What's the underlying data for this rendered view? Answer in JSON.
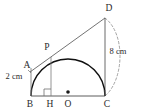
{
  "figure": {
    "type": "geometry-diagram",
    "background_color": "#ffffff",
    "stroke_color": "#3a3a3a",
    "arc_color": "#111111",
    "label_color": "#2b2b2b"
  },
  "points": {
    "A": {
      "label": "A",
      "x": 31,
      "y": 68,
      "label_x": 27,
      "label_y": 66
    },
    "B": {
      "label": "B",
      "x": 31,
      "y": 96,
      "label_x": 30,
      "label_y": 105
    },
    "H": {
      "label": "H",
      "x": 51,
      "y": 96,
      "label_x": 50,
      "label_y": 105
    },
    "O": {
      "label": "O",
      "x": 68,
      "y": 96,
      "label_x": 68,
      "label_y": 105
    },
    "C": {
      "label": "C",
      "x": 105,
      "y": 96,
      "label_x": 106,
      "label_y": 105
    },
    "P": {
      "label": "P",
      "x": 51,
      "y": 57,
      "label_x": 47,
      "label_y": 48
    },
    "D": {
      "label": "D",
      "x": 105,
      "y": 18,
      "label_x": 108,
      "label_y": 9
    }
  },
  "measurements": [
    {
      "name": "segment-ab-length",
      "text": "2 cm",
      "x": 14,
      "y": 76
    },
    {
      "name": "segment-dc-length",
      "text": "8 cm",
      "x": 117,
      "y": 52
    }
  ],
  "elements": {
    "semicircle": {
      "name": "semicircle-arc",
      "center_x": 68,
      "center_y": 96,
      "radius": 37
    },
    "baseline": {
      "name": "baseline-bc",
      "from": "B",
      "to": "C"
    },
    "vertical_ph": {
      "name": "perpendicular-p-h",
      "from": "P",
      "to": "H"
    },
    "vertical_dc": {
      "name": "segment-d-c",
      "from": "D",
      "to": "C"
    },
    "tangent": {
      "name": "tangent-line-a-p-d",
      "from": "A",
      "through": "P",
      "to": "D"
    },
    "segment_ab": {
      "name": "segment-a-b",
      "from": "A",
      "to": "B"
    },
    "dashed_arc": {
      "name": "dashed-arc-d-c",
      "from": "D",
      "to": "C"
    },
    "right_angle": {
      "name": "right-angle-marker-h",
      "x": 51,
      "y": 96,
      "size": 7
    },
    "center_dot": {
      "name": "center-point-o-dot",
      "x": 68,
      "y": 92,
      "radius": 1.8
    }
  }
}
